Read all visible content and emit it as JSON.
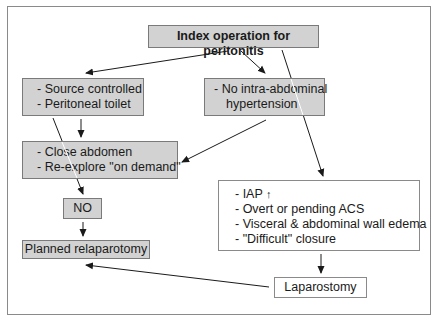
{
  "diagram": {
    "colors": {
      "gray_fill": "#d2d2d2",
      "border": "#7a7a7a",
      "arrow": "#1a1a1a"
    },
    "nodes": {
      "index": {
        "label": "Index operation for peritonitis"
      },
      "source": {
        "lines": [
          "- Source controlled",
          "- Peritoneal toilet"
        ]
      },
      "no_iah": {
        "lines": [
          "- No intra-abdominal",
          "hypertension"
        ]
      },
      "close": {
        "lines": [
          "- Close abdomen",
          "- Re-explore \"on demand\""
        ]
      },
      "no": {
        "label": "NO"
      },
      "planned": {
        "label": "Planned relaparotomy"
      },
      "iap": {
        "line1_prefix": "- IAP",
        "line1_icon": "up-arrow-icon",
        "line1_icon_glyph": "↑",
        "lines": [
          "- Overt or pending ACS",
          "- Visceral & abdominal wall edema",
          "- \"Difficult\" closure"
        ]
      },
      "laparostomy": {
        "label": "Laparostomy"
      }
    },
    "edges": [
      {
        "from": "index",
        "to": "source"
      },
      {
        "from": "index",
        "to": "no_iah"
      },
      {
        "from": "index",
        "to": "iap"
      },
      {
        "from": "source",
        "to": "close"
      },
      {
        "from": "source",
        "to": "no"
      },
      {
        "from": "no_iah",
        "to": "close"
      },
      {
        "from": "no",
        "to": "planned"
      },
      {
        "from": "iap",
        "to": "laparostomy"
      },
      {
        "from": "laparostomy",
        "to": "planned"
      }
    ]
  }
}
